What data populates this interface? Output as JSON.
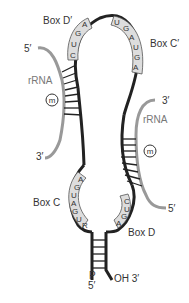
{
  "diagram": {
    "colors": {
      "snorna": "#222222",
      "rrna": "#999999",
      "box_fill": "#dddddd",
      "box_stroke": "#555555",
      "text": "#333333"
    },
    "boxes": {
      "d_prime": {
        "label": "Box D′",
        "letters": [
          "C",
          "U",
          "G",
          "A"
        ]
      },
      "c_prime": {
        "label": "Box C′",
        "letters": [
          "U",
          "G",
          "A",
          "U",
          "G",
          "A"
        ]
      },
      "c": {
        "label": "Box C",
        "letters": [
          "A",
          "G",
          "U",
          "A",
          "G",
          "U",
          "R"
        ]
      },
      "d": {
        "label": "Box D",
        "letters": [
          "C",
          "U",
          "G",
          "A"
        ]
      }
    },
    "rrna_left": {
      "label": "rRNA",
      "five_prime": "5′",
      "three_prime": "3′",
      "methyl": "m"
    },
    "rrna_right": {
      "label": "rRNA",
      "five_prime": "5′",
      "three_prime": "3′",
      "methyl": "m"
    },
    "stem": {
      "phosphate": "P",
      "five_prime": "5′",
      "hydroxyl": "OH 3′"
    }
  }
}
